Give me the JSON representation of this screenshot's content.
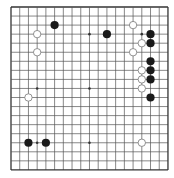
{
  "board": {
    "size": 19,
    "origin_x": 11,
    "origin_y": 7,
    "spacing_x": 8.72,
    "spacing_y": 9.05,
    "line_color": "#555555",
    "border_color": "#333333",
    "background": "#ffffff",
    "star_points": [
      [
        3,
        3
      ],
      [
        9,
        3
      ],
      [
        15,
        3
      ],
      [
        3,
        9
      ],
      [
        9,
        9
      ],
      [
        15,
        9
      ],
      [
        3,
        15
      ],
      [
        9,
        15
      ],
      [
        15,
        15
      ]
    ],
    "stone_colors": {
      "black": "#1a1a1a",
      "white_fill": "#ffffff",
      "white_stroke": "#777777"
    }
  },
  "stones": {
    "black": [
      [
        5,
        2
      ],
      [
        11,
        3
      ],
      [
        16,
        3
      ],
      [
        16,
        4
      ],
      [
        16,
        6
      ],
      [
        16,
        7
      ],
      [
        16,
        8
      ],
      [
        16,
        10
      ],
      [
        2,
        15
      ],
      [
        4,
        15
      ]
    ],
    "white": [
      [
        3,
        3
      ],
      [
        3,
        5
      ],
      [
        14,
        2
      ],
      [
        15,
        4
      ],
      [
        14,
        5
      ],
      [
        15,
        7
      ],
      [
        15,
        8
      ],
      [
        15,
        9
      ],
      [
        2,
        10
      ],
      [
        15,
        15
      ]
    ]
  }
}
